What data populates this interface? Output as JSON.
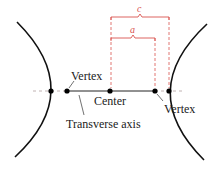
{
  "diagram": {
    "colors": {
      "curve": "#111111",
      "axis_dashed": "#999999",
      "measure": "#d9534f",
      "point": "#000000"
    },
    "labels": {
      "vertex_left": "Vertex",
      "vertex_right": "Vertex",
      "center": "Center",
      "transverse_axis": "Transverse axis",
      "c": "c",
      "a": "a"
    },
    "points": [
      {
        "name": "left-focus",
        "x": 51,
        "y": 91
      },
      {
        "name": "left-vertex",
        "x": 67,
        "y": 91
      },
      {
        "name": "center",
        "x": 110,
        "y": 91
      },
      {
        "name": "right-vertex",
        "x": 155,
        "y": 91
      },
      {
        "name": "right-focus",
        "x": 169,
        "y": 91
      }
    ]
  }
}
